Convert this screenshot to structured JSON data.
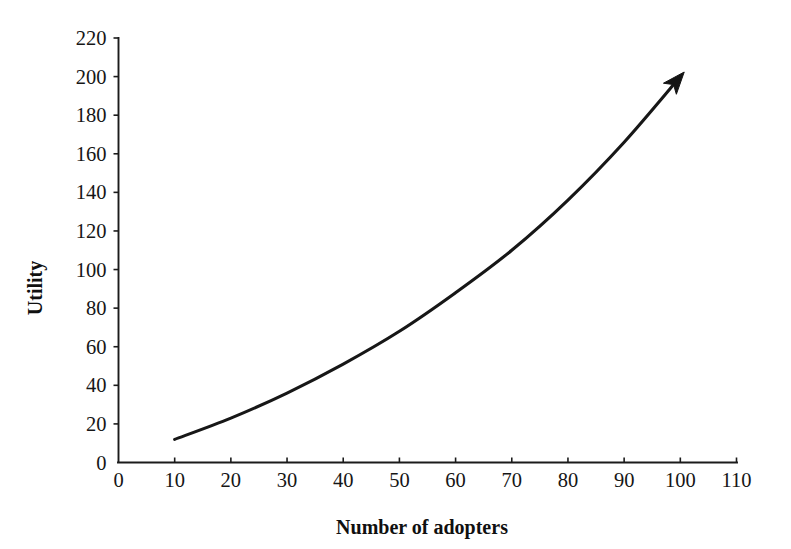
{
  "chart_data": {
    "type": "line",
    "title": "",
    "subtitle": "",
    "xlabel": "Number of adopters",
    "ylabel": "Utility",
    "xlim": [
      0,
      110
    ],
    "ylim": [
      0,
      220
    ],
    "grid": false,
    "legend": null,
    "xticks": [
      0,
      10,
      20,
      30,
      40,
      50,
      60,
      70,
      80,
      90,
      100,
      110
    ],
    "yticks": [
      0,
      20,
      40,
      60,
      80,
      100,
      120,
      140,
      160,
      180,
      200,
      220
    ],
    "xtick_labels": [
      "0",
      "10",
      "20",
      "30",
      "40",
      "50",
      "60",
      "70",
      "80",
      "90",
      "100",
      "110"
    ],
    "ytick_labels": [
      "0",
      "20",
      "40",
      "60",
      "80",
      "100",
      "120",
      "140",
      "160",
      "180",
      "200",
      "220"
    ],
    "annotations": [
      "arrowhead at curve end pointing up-right"
    ],
    "series": [
      {
        "name": "Utility of network",
        "color": "#171717",
        "arrow_end": true,
        "x": [
          10,
          20,
          30,
          40,
          50,
          60,
          70,
          80,
          90,
          100
        ],
        "y": [
          12,
          23,
          36,
          51,
          68,
          88,
          110,
          136,
          166,
          200
        ]
      }
    ]
  },
  "axes": {
    "y_label_text": "Utility",
    "x_label_text": "Number of adopters"
  },
  "colors": {
    "background": "#ffffff",
    "ink": "#171717",
    "axis": "#1b1b1b"
  }
}
